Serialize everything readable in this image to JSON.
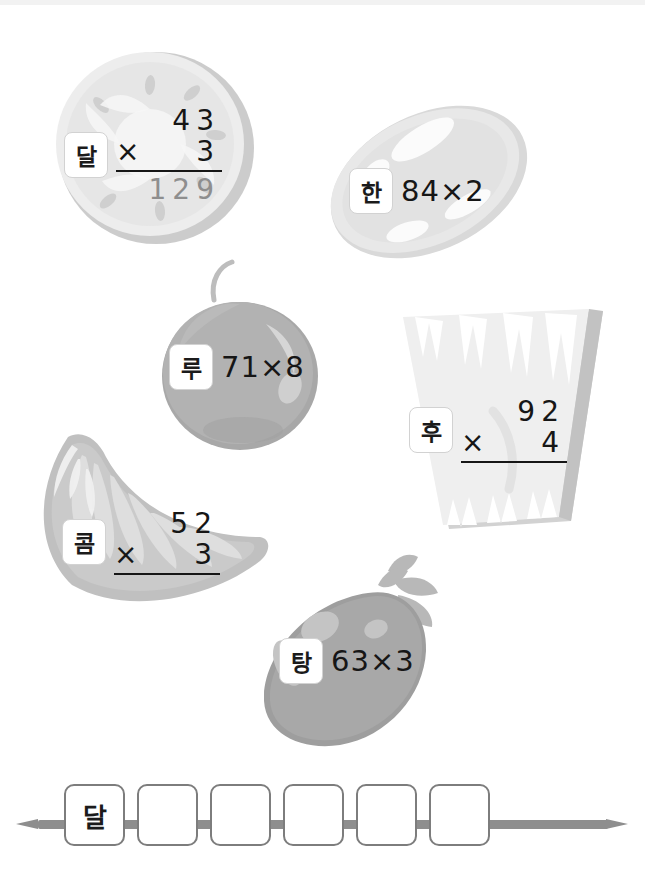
{
  "page": {
    "background": "#ffffff",
    "top_strip_color": "#f2f2f2"
  },
  "fruits": [
    {
      "id": "kiwi",
      "icon": "kiwi-slice-icon",
      "tag": "달",
      "format": "vertical",
      "top": "43",
      "op": "×",
      "bottom": "3",
      "answer": "129",
      "color": "#e7e7e7",
      "rim_color": "#c8c8c8"
    },
    {
      "id": "melon",
      "icon": "melon-icon",
      "tag": "한",
      "format": "inline",
      "expression": "84×2",
      "color": "#e3e3e3",
      "rim_color": "#d4d4d4"
    },
    {
      "id": "plum",
      "icon": "plum-icon",
      "tag": "루",
      "format": "inline",
      "expression": "71×8",
      "color": "#b0b0b0",
      "rim_color": "#a0a0a0"
    },
    {
      "id": "pineapple",
      "icon": "pineapple-slice-icon",
      "tag": "후",
      "format": "vertical",
      "top": "92",
      "op": "×",
      "bottom": "4",
      "answer": "",
      "color": "#ececec",
      "rim_color": "#cfcfcf"
    },
    {
      "id": "orange",
      "icon": "orange-segment-icon",
      "tag": "콤",
      "format": "vertical",
      "top": "52",
      "op": "×",
      "bottom": "3",
      "answer": "",
      "color": "#c6c6c6",
      "rim_color": "#b4b4b4"
    },
    {
      "id": "strawberry",
      "icon": "strawberry-icon",
      "tag": "탕",
      "format": "inline",
      "expression": "63×3",
      "color": "#a5a5a5",
      "rim_color": "#9a9a9a"
    }
  ],
  "skewer": {
    "icon": "skewer-stick-icon",
    "stick_color": "#8e8e8e",
    "boxes": [
      {
        "value": "달"
      },
      {
        "value": ""
      },
      {
        "value": ""
      },
      {
        "value": ""
      },
      {
        "value": ""
      },
      {
        "value": ""
      }
    ]
  }
}
